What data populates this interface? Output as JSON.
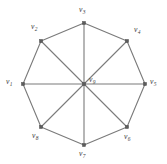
{
  "figure": {
    "width": 167,
    "height": 164,
    "background_color": "#ffffff",
    "edge_color": "#7a7a7a",
    "vertex_color": "#5c5c5c",
    "label_color": "#3d3d3d"
  },
  "graph": {
    "type": "wheel",
    "center": {
      "x": 84,
      "y": 84
    },
    "radius": 61,
    "hub": {
      "id": "v9",
      "label": "v",
      "subscript": "9",
      "x": 84,
      "y": 84,
      "label_x": 89,
      "label_y": 76
    },
    "rim_vertices": [
      {
        "id": "v1",
        "label": "v",
        "subscript": "1",
        "x": 23,
        "y": 84,
        "label_x": 6,
        "label_y": 78
      },
      {
        "id": "v2",
        "label": "v",
        "subscript": "2",
        "x": 41,
        "y": 41,
        "label_x": 31,
        "label_y": 23
      },
      {
        "id": "v3",
        "label": "v",
        "subscript": "3",
        "x": 84,
        "y": 23,
        "label_x": 79,
        "label_y": 6
      },
      {
        "id": "v4",
        "label": "v",
        "subscript": "4",
        "x": 127,
        "y": 41,
        "label_x": 134,
        "label_y": 26
      },
      {
        "id": "v5",
        "label": "v",
        "subscript": "5",
        "x": 145,
        "y": 84,
        "label_x": 150,
        "label_y": 78
      },
      {
        "id": "v6",
        "label": "v",
        "subscript": "6",
        "x": 127,
        "y": 127,
        "label_x": 124,
        "label_y": 133
      },
      {
        "id": "v7",
        "label": "v",
        "subscript": "7",
        "x": 84,
        "y": 145,
        "label_x": 79,
        "label_y": 150
      },
      {
        "id": "v8",
        "label": "v",
        "subscript": "8",
        "x": 41,
        "y": 127,
        "label_x": 32,
        "label_y": 132
      }
    ],
    "rim_edges": [
      [
        "v1",
        "v2"
      ],
      [
        "v2",
        "v3"
      ],
      [
        "v3",
        "v4"
      ],
      [
        "v4",
        "v5"
      ],
      [
        "v5",
        "v6"
      ],
      [
        "v6",
        "v7"
      ],
      [
        "v7",
        "v8"
      ],
      [
        "v8",
        "v1"
      ]
    ],
    "spoke_edges": [
      [
        "v9",
        "v1"
      ],
      [
        "v9",
        "v2"
      ],
      [
        "v9",
        "v3"
      ],
      [
        "v9",
        "v4"
      ],
      [
        "v9",
        "v5"
      ],
      [
        "v9",
        "v6"
      ],
      [
        "v9",
        "v7"
      ],
      [
        "v9",
        "v8"
      ]
    ]
  }
}
